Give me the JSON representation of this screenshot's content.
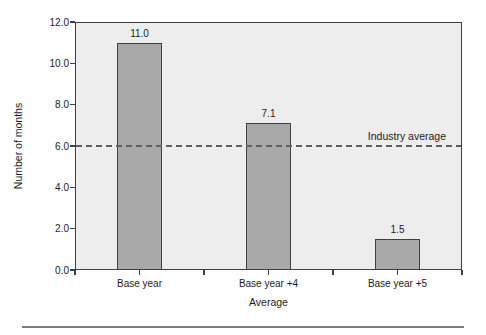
{
  "chart_data": {
    "type": "bar",
    "title": "",
    "categories": [
      "Base year",
      "Base year +4",
      "Base year +5"
    ],
    "values": [
      11.0,
      7.1,
      1.5
    ],
    "value_labels": [
      "11.0",
      "7.1",
      "1.5"
    ],
    "xlabel": "Average",
    "ylabel": "Number of months",
    "ylim": [
      0,
      12
    ],
    "yticks": [
      0,
      2,
      4,
      6,
      8,
      10,
      12
    ],
    "ytick_labels": [
      "0.0",
      "2.0",
      "4.0",
      "6.0",
      "8.0",
      "10.0",
      "12.0"
    ],
    "reference_line": {
      "value": 6.0,
      "label": "Industry average"
    },
    "grid": false,
    "legend": false,
    "bar_width_px": 45,
    "colors": {
      "plot_background": "#ededed",
      "bar_fill": "#a9a9a9",
      "bar_border": "#404040",
      "frame": "#404040",
      "reference_line": "#5f5f5f",
      "text": "#1c1c1c",
      "bottom_rule": "#7d7d7d"
    }
  }
}
